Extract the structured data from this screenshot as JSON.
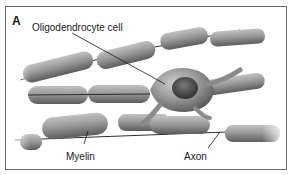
{
  "figure": {
    "panel_label": "A",
    "labels": {
      "cell": "Oligodendrocyte cell",
      "myelin": "Myelin",
      "axon": "Axon"
    },
    "colors": {
      "frame": "#6a6a6a",
      "sheath_light": "#b5b5b5",
      "sheath_mid": "#8a8a8a",
      "sheath_dark": "#5a5a5a",
      "axon_line": "#2e2e2e",
      "nucleus": "#4a4a4a"
    }
  }
}
